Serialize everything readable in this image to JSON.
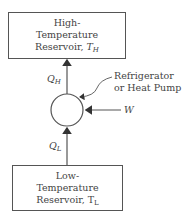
{
  "diagram": {
    "high_reservoir": {
      "lines": [
        "High-",
        "Temperature",
        "Reservoir, "
      ],
      "symbol": "T",
      "symbol_sub": "H"
    },
    "low_reservoir": {
      "lines": [
        "Low-",
        "Temperature",
        "Reservoir, "
      ],
      "symbol": "T",
      "symbol_sub": "L"
    },
    "heat_out": {
      "symbol": "Q",
      "sub": "H"
    },
    "heat_in": {
      "symbol": "Q",
      "sub": "L"
    },
    "work": {
      "symbol": "W"
    },
    "device_label": [
      "Refrigerator",
      "or Heat Pump"
    ],
    "colors": {
      "line": "#555555",
      "text": "#444444"
    }
  }
}
